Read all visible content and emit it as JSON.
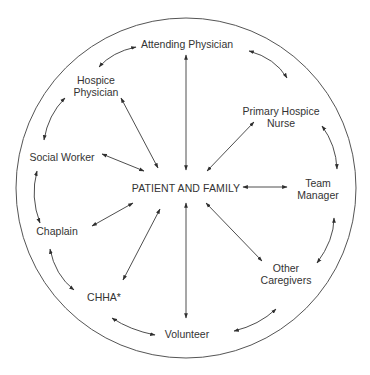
{
  "diagram": {
    "type": "hub-and-ring relationship diagram",
    "center": {
      "label": "PATIENT AND FAMILY"
    },
    "nodes": [
      {
        "id": "attending",
        "lines": [
          "Attending Physician"
        ]
      },
      {
        "id": "nurse",
        "lines": [
          "Primary Hospice",
          "Nurse"
        ]
      },
      {
        "id": "manager",
        "lines": [
          "Team",
          "Manager"
        ]
      },
      {
        "id": "other",
        "lines": [
          "Other",
          "Caregivers"
        ]
      },
      {
        "id": "volunteer",
        "lines": [
          "Volunteer"
        ]
      },
      {
        "id": "chha",
        "lines": [
          "CHHA*"
        ]
      },
      {
        "id": "chaplain",
        "lines": [
          "Chaplain"
        ]
      },
      {
        "id": "social",
        "lines": [
          "Social Worker"
        ]
      },
      {
        "id": "hospice_phys",
        "lines": [
          "Hospice",
          "Physician"
        ]
      }
    ],
    "edges_to_center": "all nine roles connect bidirectionally to PATIENT AND FAMILY",
    "ring_edges": "adjacent roles connected by curved bidirectional arrows around the circle",
    "colors": {
      "line": "#3a3a3a",
      "text": "#333333",
      "background": "#ffffff"
    }
  }
}
